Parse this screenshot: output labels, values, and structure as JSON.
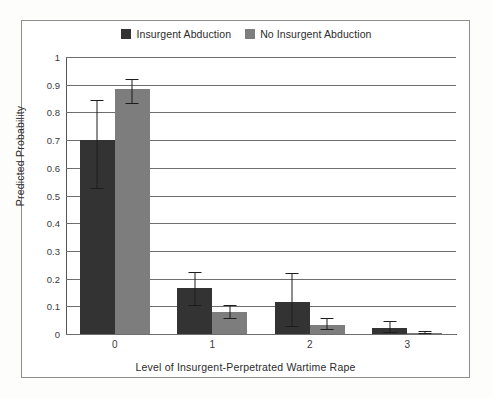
{
  "figure": {
    "background_color": "#ffffff",
    "frame_color": "#8d8d8d"
  },
  "legend": {
    "position": "top-center",
    "entries": [
      {
        "label": "Insurgent Abduction",
        "color": "#333333",
        "swatch_name": "legend-swatch-insurgent-abduction"
      },
      {
        "label": "No Insurgent Abduction",
        "color": "#7d7d7d",
        "swatch_name": "legend-swatch-no-insurgent-abduction"
      }
    ]
  },
  "axes": {
    "ylabel": "Predicted Probability",
    "xlabel": "Level of Insurgent-Perpetrated Wartime Rape",
    "ytick_labels": [
      "1",
      "0.9",
      "0.8",
      "0.7",
      "0.6",
      "0.5",
      "0.4",
      "0.3",
      "0.2",
      "0.1",
      "0"
    ],
    "xtick_labels": [
      "0",
      "1",
      "2",
      "3"
    ]
  },
  "chart_data": {
    "type": "bar",
    "title": "",
    "subtitle": "",
    "xlabel": "Level of Insurgent-Perpetrated Wartime Rape",
    "ylabel": "Predicted Probability",
    "categories": [
      "0",
      "1",
      "2",
      "3"
    ],
    "ylim": [
      0,
      1
    ],
    "ytick_values": [
      0,
      0.1,
      0.2,
      0.3,
      0.4,
      0.5,
      0.6,
      0.7,
      0.8,
      0.9,
      1
    ],
    "grid": "horizontal",
    "legend_position": "top-center",
    "error_bars": "95% confidence interval",
    "series": [
      {
        "name": "Insurgent Abduction",
        "color": "#333333",
        "values": [
          0.7,
          0.165,
          0.115,
          0.02
        ],
        "err_low": [
          0.525,
          0.1,
          0.025,
          0.004
        ],
        "err_high": [
          0.845,
          0.225,
          0.222,
          0.046
        ]
      },
      {
        "name": "No Insurgent Abduction",
        "color": "#7d7d7d",
        "values": [
          0.885,
          0.078,
          0.032,
          0.004
        ],
        "err_low": [
          0.83,
          0.055,
          0.015,
          0.001
        ],
        "err_high": [
          0.92,
          0.105,
          0.058,
          0.011
        ]
      }
    ]
  }
}
